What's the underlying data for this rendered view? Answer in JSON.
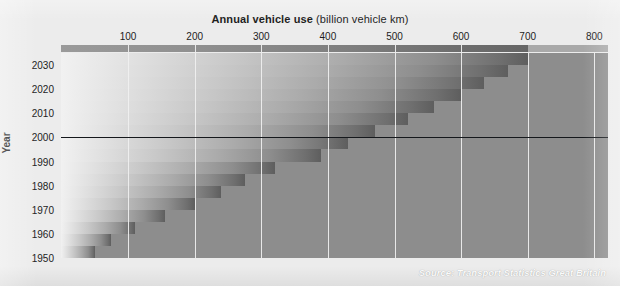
{
  "figure": {
    "width": 620,
    "height": 286,
    "background_color": "#ececec",
    "plot_background_color": "#8d8d8d",
    "gridline_color": "#f0f0f0",
    "highlight_line_color": "#15181c"
  },
  "title": {
    "strong": "Annual vehicle use",
    "light": " (billion vehicle km)"
  },
  "source": "Source: Transport Statistics Great Britain",
  "axes": {
    "y_axis_title": "Year",
    "x_tick_labels": [
      "100",
      "200",
      "300",
      "400",
      "500",
      "600",
      "700",
      "800"
    ],
    "x_tick_values": [
      100,
      200,
      300,
      400,
      500,
      600,
      700,
      800
    ],
    "y_tick_labels": [
      "2030",
      "2020",
      "2010",
      "2000",
      "1990",
      "1980",
      "1970",
      "1960",
      "1950"
    ],
    "y_tick_values": [
      2030,
      2020,
      2010,
      2000,
      1990,
      1980,
      1970,
      1960,
      1950
    ],
    "highlight_year": 2000
  },
  "chart_data": {
    "type": "bar",
    "orientation": "horizontal",
    "title": "Annual vehicle use (billion vehicle km)",
    "xlabel": "Annual vehicle use (billion vehicle km)",
    "ylabel": "Year",
    "xlim": [
      0,
      840
    ],
    "ylim": [
      1950,
      2035
    ],
    "grid": "vertical-only",
    "annotations": [
      "Source: Transport Statistics Great Britain"
    ],
    "note": "Stepped horizontal bars, one step per 5-year band, each filled with a light-to-dark gradient; projection continues past 2000 to 2030.",
    "categories": [
      1950,
      1955,
      1960,
      1965,
      1970,
      1975,
      1980,
      1985,
      1990,
      1995,
      2000,
      2005,
      2010,
      2015,
      2020,
      2025,
      2030
    ],
    "values": [
      50,
      75,
      110,
      155,
      200,
      240,
      275,
      320,
      390,
      430,
      470,
      520,
      560,
      600,
      635,
      670,
      700
    ],
    "units": "billion vehicle km"
  }
}
